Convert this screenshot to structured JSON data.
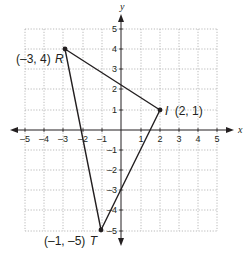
{
  "diagram": {
    "type": "coordinate-plane",
    "axes": {
      "x_label": "x",
      "y_label": "y",
      "x_range": [
        -5,
        5
      ],
      "y_range": [
        -5,
        5
      ],
      "x_ticks": [
        "–5",
        "–4",
        "–3",
        "–2",
        "–1",
        "1",
        "2",
        "3",
        "4",
        "5"
      ],
      "y_ticks": [
        "5",
        "4",
        "3",
        "2",
        "1",
        "–1",
        "–2",
        "–3",
        "–4",
        "–5"
      ]
    },
    "grid": {
      "style": "dotted",
      "color": "#9a9a9a"
    },
    "polygon": {
      "name": "triangle RIT",
      "stroke": "#231f20",
      "points": [
        {
          "name": "R",
          "x": -3,
          "y": 4,
          "coord_label": "(–3, 4)",
          "letter": "R"
        },
        {
          "name": "I",
          "x": 2,
          "y": 1,
          "coord_label": "(2, 1)",
          "letter": "I"
        },
        {
          "name": "T",
          "x": -1,
          "y": -5,
          "coord_label": "(–1, –5)",
          "letter": "T"
        }
      ]
    }
  }
}
